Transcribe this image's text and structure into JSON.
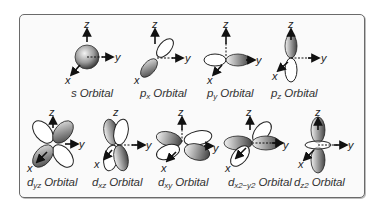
{
  "figure": {
    "axes": {
      "z": "z",
      "y": "y",
      "x": "x"
    },
    "colors": {
      "border": "#6a6a6a",
      "lobe_fill_dark": "#6e6e6e",
      "lobe_fill_light": "#e8e8e8",
      "text": "#333333"
    },
    "rows": [
      {
        "orbitals": [
          {
            "id": "s",
            "main": "s",
            "sub": "",
            "suffix": " Orbital"
          },
          {
            "id": "px",
            "main": "p",
            "sub": "x",
            "suffix": " Orbital"
          },
          {
            "id": "py",
            "main": "p",
            "sub": "y",
            "suffix": " Orbital"
          },
          {
            "id": "pz",
            "main": "p",
            "sub": "z",
            "suffix": " Orbital"
          }
        ]
      },
      {
        "orbitals": [
          {
            "id": "dyz",
            "main": "d",
            "sub": "yz",
            "suffix": " Orbital"
          },
          {
            "id": "dxz",
            "main": "d",
            "sub": "xz",
            "suffix": " Orbital"
          },
          {
            "id": "dxy",
            "main": "d",
            "sub": "xy",
            "suffix": " Orbital"
          },
          {
            "id": "dx2y2",
            "main": "d",
            "sub": "x2−y2",
            "suffix": " Orbital"
          },
          {
            "id": "dz2",
            "main": "d",
            "sub": "z2",
            "suffix": " Orbital"
          }
        ]
      }
    ]
  }
}
